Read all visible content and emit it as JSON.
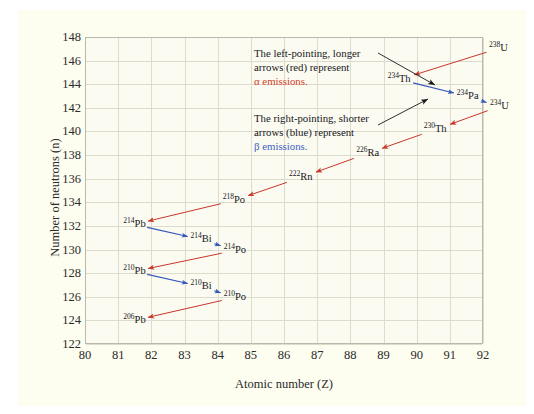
{
  "figure": {
    "background_color": "#fdfdf0",
    "plot_background_color": "#fbfbf1",
    "grid_color": "#dcdccd"
  },
  "chart_data": {
    "type": "scatter",
    "title": "",
    "xlabel": "Atomic number (Z)",
    "ylabel": "Number of neutrons (n)",
    "xlim": [
      80,
      92
    ],
    "ylim": [
      122,
      148
    ],
    "xticks": [
      "80",
      "81",
      "82",
      "83",
      "84",
      "85",
      "86",
      "87",
      "88",
      "89",
      "90",
      "91",
      "92"
    ],
    "yticks": [
      "148",
      "146",
      "144",
      "142",
      "140",
      "138",
      "136",
      "134",
      "132",
      "130",
      "128",
      "126",
      "124",
      "122"
    ],
    "grid": true,
    "legend": "none",
    "alpha_color": "#c8372a",
    "beta_color": "#3355bb",
    "annotation_color": "#17171c",
    "nuclides": [
      {
        "id": "U238",
        "mass": "238",
        "element": "U",
        "z": 92,
        "n": 146
      },
      {
        "id": "Th234",
        "mass": "234",
        "element": "Th",
        "z": 90,
        "n": 144
      },
      {
        "id": "Pa234",
        "mass": "234",
        "element": "Pa",
        "z": 91,
        "n": 143
      },
      {
        "id": "U234",
        "mass": "234",
        "element": "U",
        "z": 92,
        "n": 142
      },
      {
        "id": "Th230",
        "mass": "230",
        "element": "Th",
        "z": 90,
        "n": 140
      },
      {
        "id": "Ra226",
        "mass": "226",
        "element": "Ra",
        "z": 88,
        "n": 138
      },
      {
        "id": "Rn222",
        "mass": "222",
        "element": "Rn",
        "z": 86,
        "n": 136
      },
      {
        "id": "Po218",
        "mass": "218",
        "element": "Po",
        "z": 84,
        "n": 134
      },
      {
        "id": "Pb214",
        "mass": "214",
        "element": "Pb",
        "z": 82,
        "n": 132
      },
      {
        "id": "Bi214",
        "mass": "214",
        "element": "Bi",
        "z": 83,
        "n": 131
      },
      {
        "id": "Po214",
        "mass": "214",
        "element": "Po",
        "z": 84,
        "n": 130
      },
      {
        "id": "Pb210",
        "mass": "210",
        "element": "Pb",
        "z": 82,
        "n": 128
      },
      {
        "id": "Bi210",
        "mass": "210",
        "element": "Bi",
        "z": 83,
        "n": 127
      },
      {
        "id": "Po210",
        "mass": "210",
        "element": "Po",
        "z": 84,
        "n": 126
      },
      {
        "id": "Pb206",
        "mass": "206",
        "element": "Pb",
        "z": 82,
        "n": 124
      }
    ],
    "decays": [
      {
        "from": "U238",
        "to": "Th234",
        "type": "alpha"
      },
      {
        "from": "Th234",
        "to": "Pa234",
        "type": "beta"
      },
      {
        "from": "Pa234",
        "to": "U234",
        "type": "beta"
      },
      {
        "from": "U234",
        "to": "Th230",
        "type": "alpha"
      },
      {
        "from": "Th230",
        "to": "Ra226",
        "type": "alpha"
      },
      {
        "from": "Ra226",
        "to": "Rn222",
        "type": "alpha"
      },
      {
        "from": "Rn222",
        "to": "Po218",
        "type": "alpha"
      },
      {
        "from": "Po218",
        "to": "Pb214",
        "type": "alpha"
      },
      {
        "from": "Pb214",
        "to": "Bi214",
        "type": "beta"
      },
      {
        "from": "Bi214",
        "to": "Po214",
        "type": "beta"
      },
      {
        "from": "Po214",
        "to": "Pb210",
        "type": "alpha"
      },
      {
        "from": "Pb210",
        "to": "Bi210",
        "type": "beta"
      },
      {
        "from": "Bi210",
        "to": "Po210",
        "type": "beta"
      },
      {
        "from": "Po210",
        "to": "Pb206",
        "type": "alpha"
      }
    ]
  },
  "annotations": {
    "alpha_note": {
      "line1": "The left-pointing, longer",
      "line2": "arrows (red) represent",
      "line3": "α emissions."
    },
    "beta_note": {
      "line1": "The right-pointing, shorter",
      "line2": "arrows (blue) represent",
      "line3": "β emissions."
    }
  }
}
